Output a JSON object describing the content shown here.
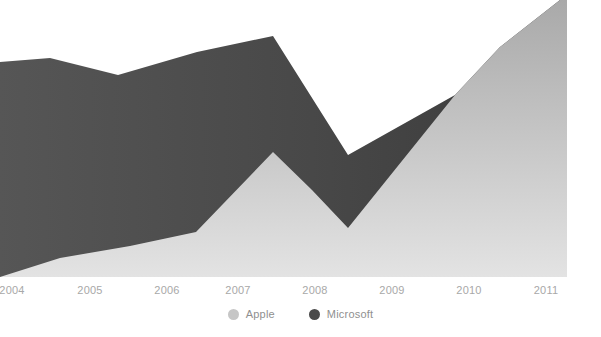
{
  "chart_data": {
    "type": "area",
    "stacked": false,
    "title": "",
    "subtitle": "",
    "xlabel": "",
    "ylabel": "",
    "grid": false,
    "legend_position": "bottom-center",
    "xlim": [
      2003.85,
      2011.3
    ],
    "ylim": [
      0,
      100
    ],
    "x_tick_labels": [
      "2004",
      "2005",
      "2006",
      "2007",
      "2008",
      "2009",
      "2010",
      "2011"
    ],
    "x": [
      2004,
      2005,
      2006,
      2007,
      2008,
      2009,
      2010,
      2011
    ],
    "series": [
      {
        "name": "Apple",
        "color": "#bdbdbd",
        "values": [
          0,
          6,
          16,
          45,
          24,
          18,
          66,
          100
        ]
      },
      {
        "name": "Microsoft",
        "color": "#4a4a4a",
        "values": [
          78,
          75,
          72,
          87,
          60,
          44,
          66,
          100
        ]
      }
    ],
    "annotations": []
  },
  "axis": {
    "ticks": [
      {
        "label": "2004",
        "x_px": 12
      },
      {
        "label": "2005",
        "x_px": 90
      },
      {
        "label": "2006",
        "x_px": 167
      },
      {
        "label": "2007",
        "x_px": 238
      },
      {
        "label": "2008",
        "x_px": 315
      },
      {
        "label": "2009",
        "x_px": 392
      },
      {
        "label": "2010",
        "x_px": 469
      },
      {
        "label": "2011",
        "x_px": 546
      }
    ]
  },
  "legend": {
    "items": [
      {
        "label": "Apple",
        "color": "#c6c6c6"
      },
      {
        "label": "Microsoft",
        "color": "#4a4a4a"
      }
    ]
  },
  "colors": {
    "apple_area": "#bdbdbd",
    "microsoft_area": "#4a4a4a",
    "background": "#ffffff",
    "tick_text": "#a8a8a8",
    "legend_text": "#8f8f8f"
  },
  "geometry": {
    "plot_left": 0,
    "plot_right": 567,
    "plot_top": 0,
    "plot_bottom": 277,
    "microsoft_top_points": "0,62 50,58 118,75 197,52 273,36 348,155 455,95 500,47 560,0 567,0",
    "apple_top_points": "0,277 60,258 130,246 196,232 273,152 312,190 348,228 455,95 500,47 560,0 567,0"
  }
}
